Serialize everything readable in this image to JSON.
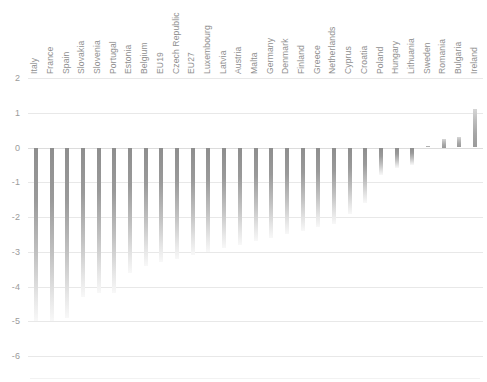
{
  "chart_data": {
    "type": "bar",
    "title": "",
    "subtitle": "",
    "xlabel": "",
    "ylabel": "",
    "ylim": [
      -6,
      2
    ],
    "yticks": [
      2,
      1,
      0,
      -1,
      -2,
      -3,
      -4,
      -5,
      -6
    ],
    "ytick_labels": [
      "2",
      "1",
      "0",
      "-1",
      "-2",
      "-3",
      "-4",
      "-5",
      "-6"
    ],
    "grid": true,
    "legend": "none",
    "orientation": "vertical",
    "bar_color": "#9a9a9a",
    "categories": [
      "Italy",
      "France",
      "Spain",
      "Slovakia",
      "Slovenia",
      "Portugal",
      "Estonia",
      "Belgium",
      "EU19",
      "Czech Republic",
      "EU27",
      "Luxembourg",
      "Latvia",
      "Austria",
      "Malta",
      "Germany",
      "Denmark",
      "Finland",
      "Greece",
      "Netherlands",
      "Cyprus",
      "Croatia",
      "Poland",
      "Hungary",
      "Lithuania",
      "Sweden",
      "Romania",
      "Bulgaria",
      "Ireland"
    ],
    "values": [
      -5.0,
      -5.0,
      -4.9,
      -4.3,
      -4.2,
      -4.2,
      -3.6,
      -3.4,
      -3.3,
      -3.2,
      -3.1,
      -3.0,
      -2.9,
      -2.8,
      -2.7,
      -2.6,
      -2.5,
      -2.4,
      -2.3,
      -2.2,
      -1.9,
      -1.6,
      -0.8,
      -0.6,
      -0.5,
      0.05,
      0.25,
      0.3,
      1.1
    ]
  }
}
